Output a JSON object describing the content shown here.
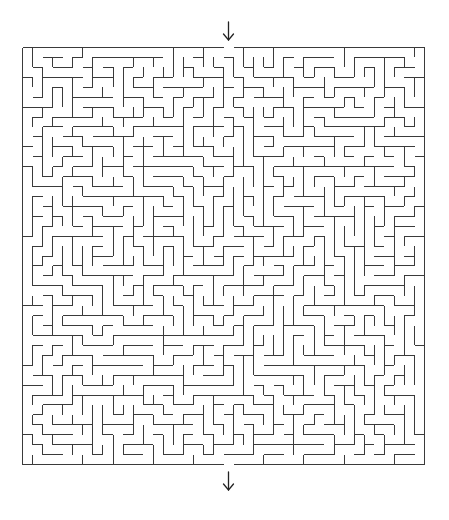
{
  "puzzle": {
    "type": "rectangular-maze",
    "columns": 40,
    "rows": 42,
    "entrance": {
      "side": "top",
      "column": 20,
      "marker": "down-arrow-icon"
    },
    "exit": {
      "side": "bottom",
      "column": 20,
      "marker": "down-arrow-icon"
    },
    "generator_seed": 7331
  },
  "colors": {
    "wall": "#3a3a3a",
    "background": "#ffffff",
    "arrow": "#222222"
  }
}
